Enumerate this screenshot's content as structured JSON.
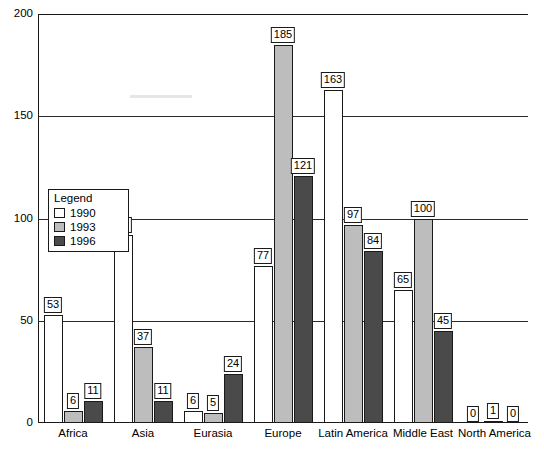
{
  "chart_data": {
    "type": "bar",
    "title": "",
    "subtitle": "",
    "xlabel": "",
    "ylabel": "",
    "ylim": [
      0,
      200
    ],
    "yticks": [
      0,
      50,
      100,
      150,
      200
    ],
    "ytick_labels": [
      "0",
      "50",
      "100",
      "150",
      "200"
    ],
    "grid": true,
    "legend_position": "inside-left",
    "legend_title": "Legend",
    "categories": [
      "Africa",
      "Asia",
      "Eurasia",
      "Europe",
      "Latin America",
      "Middle East",
      "North America"
    ],
    "series": [
      {
        "name": "1990",
        "color": "#ffffff",
        "values": [
          53,
          92,
          6,
          77,
          163,
          65,
          0
        ]
      },
      {
        "name": "1993",
        "color": "#bdbdbd",
        "values": [
          6,
          37,
          5,
          185,
          97,
          100,
          1
        ]
      },
      {
        "name": "1996",
        "color": "#4a4a4a",
        "values": [
          11,
          11,
          24,
          121,
          84,
          45,
          0
        ]
      }
    ],
    "data_labels": [
      [
        "53",
        "6",
        "11"
      ],
      [
        "92",
        "37",
        "11"
      ],
      [
        "6",
        "5",
        "24"
      ],
      [
        "77",
        "185",
        "121"
      ],
      [
        "163",
        "97",
        "84"
      ],
      [
        "65",
        "100",
        "45"
      ],
      [
        "0",
        "1",
        "0"
      ]
    ]
  },
  "caption": ""
}
